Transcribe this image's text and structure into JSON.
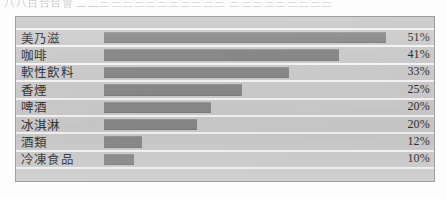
{
  "page": {
    "top_text_fragment": "八八百合合會   二二三三三三三三三三三三三  三三三三三三三三三"
  },
  "chart_data": {
    "type": "bar",
    "orientation": "horizontal",
    "title": "",
    "xlabel": "",
    "ylabel": "",
    "grid": false,
    "legend": "none",
    "value_suffix": "%",
    "categories": [
      "美乃滋",
      "咖啡",
      "軟性飲料",
      "香煙",
      "啤酒",
      "冰淇淋",
      "酒類",
      "冷凍食品"
    ],
    "values": [
      51,
      41,
      33,
      25,
      20,
      20,
      12,
      10
    ],
    "value_labels": [
      "51%",
      "41%",
      "33%",
      "25%",
      "20%",
      "20%",
      "12%",
      "10%"
    ],
    "bar_pixel_fractions": [
      1.0,
      0.835,
      0.655,
      0.49,
      0.38,
      0.33,
      0.135,
      0.105
    ],
    "xlim": [
      0,
      51
    ],
    "colors": {
      "bar": "#848484",
      "plot_background": "#c9c9c9",
      "separator": "#f4f4f4",
      "frame_border": "#9a9a9a",
      "text": "#2c2c2c"
    }
  }
}
